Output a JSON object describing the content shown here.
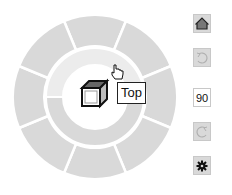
{
  "wheel": {
    "outer_segments": [
      "front",
      "front-right",
      "right",
      "back-right",
      "back",
      "back-left",
      "left",
      "front-left"
    ],
    "inner_segments": [
      "top",
      "bottom"
    ],
    "center_icon": "cube-icon",
    "hover_segment": "top",
    "tooltip": "Top",
    "cursor_icon": "hand-pointer-icon"
  },
  "toolbar": {
    "home_icon": "home-icon",
    "rotate_ccw_icon": "rotate-ccw-icon",
    "angle_value": "90",
    "rotate_cw_icon": "rotate-cw-icon",
    "settings_icon": "gear-icon"
  },
  "colors": {
    "segment_fill": "#d9d9d9",
    "segment_hover": "#ececec",
    "border": "#ffffff",
    "button_fill": "#d9d9d9"
  }
}
